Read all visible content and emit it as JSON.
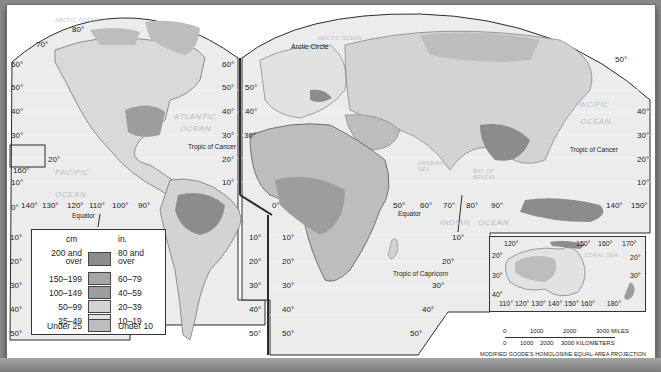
{
  "map": {
    "title": "World Average Annual Precipitation",
    "projection": "MODIFIED GOODE'S HOMOLOSINE EQUAL-AREA PROJECTION",
    "colors": {
      "water": "#ececec",
      "land_lightest": "#e2e2e2",
      "border": "#2b2b2b",
      "frame": "#333333"
    },
    "oceans": {
      "arctic_left": "ARCTIC OCEAN",
      "arctic_right": "ARCTIC OCEAN",
      "atlantic_1": "ATLANTIC",
      "atlantic_2": "OCEAN",
      "pacific_left_1": "PACIFIC",
      "pacific_left_2": "OCEAN",
      "pacific_right_1": "PACIFIC",
      "pacific_right_2": "OCEAN",
      "indian_1": "INDIAN",
      "indian_2": "OCEAN",
      "arabian_sea": "ARABIAN SEA",
      "bay_of_bengal": "BAY OF BENGAL",
      "coral_sea": "CORAL SEA"
    },
    "lines": {
      "arctic_circle": "Arctic Circle",
      "tropic_cancer_left": "Tropic of Cancer",
      "tropic_cancer_right": "Tropic of Cancer",
      "equator_left": "Equator",
      "equator_right": "Equator",
      "tropic_capricorn": "Tropic of Capricorn"
    },
    "lat_labels": {
      "l80": "80°",
      "l70": "70°",
      "a60": "60°",
      "a50": "50°",
      "a40": "40°",
      "a30": "30°",
      "a20": "20°",
      "a10": "10°",
      "a0": "0°",
      "b60": "60°",
      "b50": "50°",
      "b40": "40°",
      "b30": "30°",
      "b20": "20°",
      "b10": "10°",
      "c50": "50°",
      "c40": "40°",
      "c30": "30°",
      "c20": "20°",
      "c10": "10°",
      "d50": "50°",
      "d40": "40°",
      "d30": "30°",
      "d20": "20°",
      "d10": "10°",
      "e10": "10°",
      "e20": "20°",
      "e30": "30°",
      "e40": "40°",
      "e50": "50°",
      "f10": "10°",
      "f20": "20°",
      "f30": "30°",
      "f40": "40°",
      "f50": "50°",
      "g50": "50°",
      "g40": "40°",
      "g30": "30°",
      "g20": "20°",
      "g10": "10°",
      "s10": "10°",
      "s20": "20°",
      "s30": "30°",
      "s40": "40°",
      "s50": "50°"
    },
    "lon_labels": {
      "w140": "140°",
      "w130": "130°",
      "w120": "120°",
      "w110": "110°",
      "w100": "100°",
      "w90": "90°",
      "hawaii": "160°",
      "hawaii_lat": "20°",
      "e0": "0°",
      "e50": "50°",
      "e60": "60°",
      "e70": "70°",
      "e80": "80°",
      "e90": "90°",
      "e140": "140°",
      "e150": "150°"
    },
    "inset": {
      "top": [
        "120°",
        "150°",
        "160°",
        "170°"
      ],
      "left": [
        "20°",
        "30°",
        "40°"
      ],
      "right": [
        "20°",
        "30°"
      ],
      "bottom": [
        "110°",
        "120°",
        "130°",
        "140°",
        "150°",
        "160°",
        "180°"
      ]
    },
    "scale": {
      "miles_ticks": [
        "0",
        "1000",
        "2000",
        "3000 MILES"
      ],
      "km_ticks": [
        "0",
        "1000",
        "2000",
        "3000 KILOMETERS"
      ]
    }
  },
  "legend": {
    "header_cm": "cm",
    "header_in": "in.",
    "rows": [
      {
        "cm": "200 and over",
        "cm_1": "200 and",
        "cm_2": "over",
        "in": "80 and over",
        "in_1": "80 and",
        "in_2": "over",
        "color": "#8c8c8c"
      },
      {
        "cm": "150–199",
        "in": "60–79",
        "color": "#a6a6a6"
      },
      {
        "cm": "100–149",
        "in": "40–59",
        "color": "#9d9d9d"
      },
      {
        "cm": "50–99",
        "in": "20–39",
        "color": "#d3d3d3"
      },
      {
        "cm": "25–49",
        "in": "10–19",
        "color": "#e2e2e2"
      },
      {
        "cm": "Under 25",
        "in": "Under 10",
        "color": "#bdbdbd"
      }
    ]
  }
}
